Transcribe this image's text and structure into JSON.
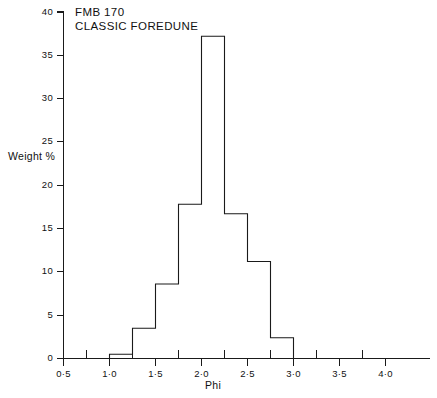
{
  "chart_data": {
    "type": "bar",
    "title": "FMB 170 CLASSIC FOREDUNE",
    "title_lines": [
      "FMB 170",
      "CLASSIC FOREDUNE"
    ],
    "xlabel": "Phi",
    "ylabel": "Weight %",
    "xlim": [
      0.5,
      4.25
    ],
    "ylim": [
      0,
      40
    ],
    "grid": false,
    "legend": "none",
    "bin_width": 0.25,
    "bin_edges": [
      1.0,
      1.25,
      1.5,
      1.75,
      2.0,
      2.25,
      2.5,
      2.75,
      3.0
    ],
    "categories": [
      "1.00-1.25",
      "1.25-1.50",
      "1.50-1.75",
      "1.75-2.00",
      "2.00-2.25",
      "2.25-2.50",
      "2.50-2.75",
      "2.75-3.00"
    ],
    "values": [
      0.5,
      3.5,
      8.6,
      17.8,
      37.2,
      16.7,
      11.2,
      2.4
    ],
    "x_ticks_major": [
      0.5,
      1.0,
      1.5,
      2.0,
      2.5,
      3.0,
      3.5,
      4.0
    ],
    "x_tick_labels": [
      "0·5",
      "1·0",
      "1·5",
      "2·0",
      "2·5",
      "3·0",
      "3·5",
      "4·0"
    ],
    "x_ticks_minor": [
      0.75,
      1.25,
      1.75,
      2.25,
      2.75,
      3.25,
      3.75
    ],
    "y_ticks": [
      0,
      5,
      10,
      15,
      20,
      25,
      30,
      35,
      40
    ],
    "y_tick_labels": [
      "0",
      "5",
      "10",
      "15",
      "20",
      "25",
      "30",
      "35",
      "40"
    ],
    "line_color": "#1a1a1a",
    "background_color": "#ffffff"
  },
  "figure": {
    "title_line_1": "FMB 170",
    "title_line_2": "CLASSIC FOREDUNE",
    "y_axis_label": "Weight %",
    "x_axis_label": "Phi"
  },
  "y_labels": {
    "t0": "0",
    "t5": "5",
    "t10": "10",
    "t15": "15",
    "t20": "20",
    "t25": "25",
    "t30": "30",
    "t35": "35",
    "t40": "40"
  },
  "x_labels": {
    "t05": "0·5",
    "t10": "1·0",
    "t15": "1·5",
    "t20": "2·0",
    "t25": "2·5",
    "t30": "3·0",
    "t35": "3·5",
    "t40": "4·0"
  }
}
